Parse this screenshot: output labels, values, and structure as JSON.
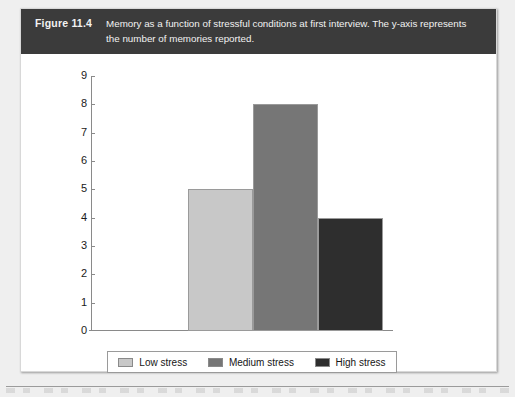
{
  "figure": {
    "number_label": "Figure 11.4",
    "caption": "Memory as a function of stressful conditions at first interview. The y-axis represents the number of memories reported."
  },
  "colors": {
    "caption_band": "#3b3b3b",
    "panel_background": "#ffffff",
    "page_background": "#efefef",
    "axis_line": "#8a8a8a",
    "bar_low": "#c8c8c8",
    "bar_medium": "#767676",
    "bar_high": "#2e2e2e"
  },
  "chart_data": {
    "type": "bar",
    "title": "",
    "xlabel": "",
    "ylabel": "",
    "categories": [
      "Low stress",
      "Medium stress",
      "High stress"
    ],
    "values": [
      5,
      8,
      4
    ],
    "bar_colors": [
      "#c8c8c8",
      "#767676",
      "#2e2e2e"
    ],
    "ylim": [
      0,
      9
    ],
    "ytick_labels": [
      "0",
      "1",
      "2",
      "3",
      "4",
      "5",
      "6",
      "7",
      "8",
      "9"
    ],
    "yticks": [
      0,
      1,
      2,
      3,
      4,
      5,
      6,
      7,
      8,
      9
    ],
    "grid": false,
    "legend": {
      "position": "bottom",
      "entries": [
        {
          "label": "Low stress",
          "color": "#c8c8c8"
        },
        {
          "label": "Medium stress",
          "color": "#767676"
        },
        {
          "label": "High stress",
          "color": "#2e2e2e"
        }
      ]
    }
  }
}
